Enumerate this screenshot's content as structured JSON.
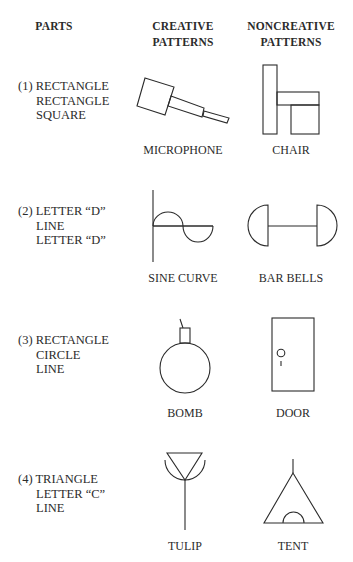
{
  "headers": {
    "parts": "PARTS",
    "creative": [
      "CREATIVE",
      "PATTERNS"
    ],
    "noncreative": [
      "NONCREATIVE",
      "PATTERNS"
    ]
  },
  "rows": [
    {
      "parts": [
        "(1) RECTANGLE",
        "RECTANGLE",
        "SQUARE"
      ],
      "creative_label": "MICROPHONE",
      "noncreative_label": "CHAIR"
    },
    {
      "parts": [
        "(2) LETTER “D”",
        "LINE",
        "LETTER “D”"
      ],
      "creative_label": "SINE CURVE",
      "noncreative_label": "BAR BELLS"
    },
    {
      "parts": [
        "(3) RECTANGLE",
        "CIRCLE",
        "LINE"
      ],
      "creative_label": "BOMB",
      "noncreative_label": "DOOR"
    },
    {
      "parts": [
        "(4) TRIANGLE",
        "LETTER “C”",
        "LINE"
      ],
      "creative_label": "TULIP",
      "noncreative_label": "TENT"
    }
  ]
}
